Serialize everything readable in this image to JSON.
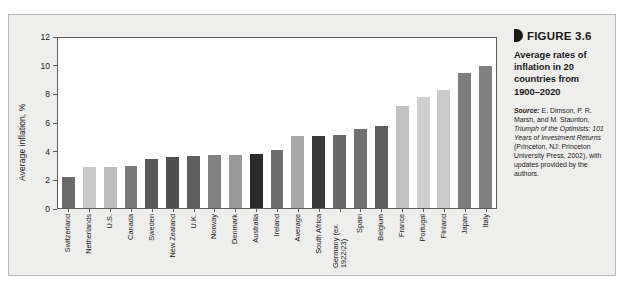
{
  "figure": {
    "marker_icon": "figure-bullet-icon",
    "number": "FIGURE 3.6",
    "title": "Average rates of inflation in 20 countries from 1900–2020",
    "source_label": "Source:",
    "source_part1": " E. Dimson, P. R. Marsh, and M. Staunton, ",
    "source_italic1": "Triumph of the Optimists: 101 Years of Investment Returns",
    "source_part2": " (Princeton, NJ: Princeton University Press, 2002), with updates provided by the authors."
  },
  "chart_data": {
    "type": "bar",
    "title": "Average rates of inflation in 20 countries from 1900–2020",
    "xlabel": "",
    "ylabel": "Average inflation, %",
    "ylim": [
      0,
      12
    ],
    "yticks": [
      0,
      2,
      4,
      6,
      8,
      10,
      12
    ],
    "ytick_labels": [
      "0",
      "2",
      "4",
      "6",
      "8",
      "10",
      "12"
    ],
    "grid": false,
    "legend": "none",
    "categories": [
      "Switzerland",
      "Netherlands",
      "U.S.",
      "Canada",
      "Sweden",
      "New Zealand",
      "U.K.",
      "Norway",
      "Denmark",
      "Australia",
      "Ireland",
      "Average",
      "South Africa",
      "Germany (ex. 1922/23)",
      "Spain",
      "Belgium",
      "France",
      "Portugal",
      "Finland",
      "Japan",
      "Italy"
    ],
    "values": [
      2.2,
      2.9,
      2.9,
      3.0,
      3.45,
      3.6,
      3.7,
      3.75,
      3.75,
      3.8,
      4.1,
      5.05,
      5.05,
      5.15,
      5.55,
      5.8,
      7.2,
      7.85,
      8.35,
      9.55,
      10.0
    ],
    "bar_colors": [
      "#6b6b6b",
      "#c9c9c9",
      "#bdbdbd",
      "#7a7a7a",
      "#5a5a5a",
      "#4f4f4f",
      "#5f5f5f",
      "#818181",
      "#9a9a9a",
      "#2b2b2b",
      "#6e6e6e",
      "#a9a9a9",
      "#3a3a3a",
      "#696969",
      "#707070",
      "#5e5e5e",
      "#c2c2c2",
      "#cfcfcf",
      "#cacaca",
      "#7d7d7d",
      "#808080"
    ],
    "axis_color": "#5c5c5c",
    "plot_background": "#ffffff",
    "panel_background": "#eeeeec"
  }
}
